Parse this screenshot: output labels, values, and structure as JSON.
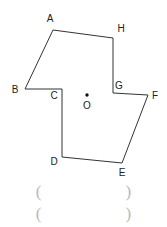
{
  "figure": {
    "type": "labeled-polygon-geometry-diagram",
    "background_color": "#ffffff",
    "stroke_color": "#333333",
    "stroke_width": 1,
    "width": 167,
    "height": 227,
    "polygon": {
      "closed": true,
      "order": [
        "A",
        "H",
        "G",
        "F",
        "E",
        "D",
        "C",
        "B"
      ],
      "vertices": [
        {
          "name": "A",
          "x": 53,
          "y": 30,
          "label": "A",
          "label_x": 50,
          "label_y": 19
        },
        {
          "name": "H",
          "x": 113,
          "y": 38,
          "label": "H",
          "label_x": 121,
          "label_y": 29
        },
        {
          "name": "G",
          "x": 113,
          "y": 93,
          "label": "G",
          "label_x": 119,
          "label_y": 86
        },
        {
          "name": "F",
          "x": 148,
          "y": 95,
          "label": "F",
          "label_x": 155,
          "label_y": 96
        },
        {
          "name": "E",
          "x": 122,
          "y": 163,
          "label": "E",
          "label_x": 122,
          "label_y": 173
        },
        {
          "name": "D",
          "x": 62,
          "y": 157,
          "label": "D",
          "label_x": 54,
          "label_y": 162
        },
        {
          "name": "C",
          "x": 62,
          "y": 89,
          "label": "C",
          "label_x": 54,
          "label_y": 96
        },
        {
          "name": "B",
          "x": 25,
          "y": 89,
          "label": "B",
          "label_x": 15,
          "label_y": 90
        }
      ]
    },
    "center_point": {
      "label": "O",
      "dot_x": 87,
      "dot_y": 95,
      "dot_radius": 1.7,
      "label_x": 87,
      "label_y": 106
    }
  },
  "answer_rows": [
    {
      "open": "(",
      "close": ")",
      "value": "",
      "top": 181
    },
    {
      "open": "(",
      "close": ")",
      "value": "",
      "top": 203
    }
  ],
  "colors": {
    "stroke": "#333333",
    "label_text": "#222222",
    "answer_paren": "#b9b9b9",
    "background": "#ffffff"
  }
}
